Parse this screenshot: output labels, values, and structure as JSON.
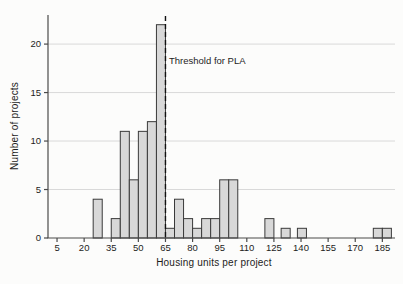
{
  "colors": {
    "background": "#fcfcfb",
    "bar_fill": "#d8d8d8",
    "bar_stroke": "#3a3a3a",
    "grid": "#d9d9d9",
    "axis": "#4a4a4a",
    "tick_text": "#1c1c1c",
    "threshold_line": "#111111"
  },
  "chart_data": {
    "type": "bar",
    "subtype": "histogram",
    "xlabel": "Housing units per project",
    "ylabel": "Number of projects",
    "bin_width": 5,
    "bars": [
      {
        "bin_start": 25,
        "count": 4
      },
      {
        "bin_start": 35,
        "count": 2
      },
      {
        "bin_start": 40,
        "count": 11
      },
      {
        "bin_start": 45,
        "count": 6
      },
      {
        "bin_start": 50,
        "count": 11
      },
      {
        "bin_start": 55,
        "count": 12
      },
      {
        "bin_start": 60,
        "count": 22
      },
      {
        "bin_start": 65,
        "count": 1
      },
      {
        "bin_start": 70,
        "count": 4
      },
      {
        "bin_start": 75,
        "count": 2
      },
      {
        "bin_start": 80,
        "count": 1
      },
      {
        "bin_start": 85,
        "count": 2
      },
      {
        "bin_start": 90,
        "count": 2
      },
      {
        "bin_start": 95,
        "count": 6
      },
      {
        "bin_start": 100,
        "count": 6
      },
      {
        "bin_start": 120,
        "count": 2
      },
      {
        "bin_start": 129,
        "count": 1
      },
      {
        "bin_start": 138,
        "count": 1
      },
      {
        "bin_start": 180,
        "count": 1
      },
      {
        "bin_start": 185,
        "count": 1
      }
    ],
    "x_ticks": [
      5,
      20,
      35,
      50,
      65,
      80,
      95,
      110,
      125,
      140,
      155,
      170,
      185
    ],
    "y_ticks": [
      0,
      5,
      10,
      15,
      20
    ],
    "xlim": [
      0,
      192
    ],
    "ylim": [
      0,
      23
    ],
    "grid": "horizontal",
    "annotation": {
      "label": "Threshold for PLA",
      "x": 65,
      "style": "dashed-vertical-line"
    }
  }
}
